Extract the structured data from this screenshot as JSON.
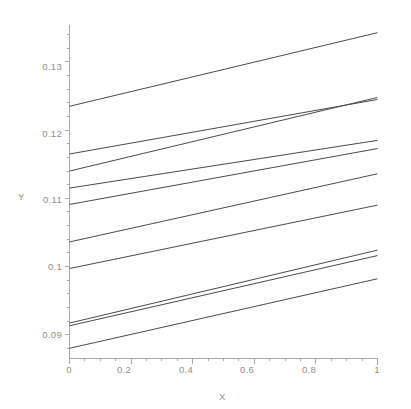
{
  "chart_data": {
    "type": "line",
    "title": "",
    "xlabel": "X",
    "ylabel": "Y",
    "xlim": [
      0,
      1
    ],
    "ylim": [
      0.0865,
      0.1355
    ],
    "grid": false,
    "legend": "none",
    "x_ticks": [
      0,
      0.2,
      0.4,
      0.6,
      0.8,
      1
    ],
    "x_tick_labels": [
      "0",
      "0.2",
      "0.4",
      "0.6",
      "0.8",
      "1"
    ],
    "y_ticks": [
      0.09,
      0.1,
      0.11,
      0.12,
      0.13
    ],
    "y_tick_labels": [
      "0.09",
      "0.1",
      "0.11",
      "0.12",
      "0.13"
    ],
    "x": [
      0,
      1
    ],
    "series": [
      {
        "name": "line-1",
        "values": [
          0.1235,
          0.1343
        ]
      },
      {
        "name": "line-2",
        "values": [
          0.1165,
          0.1245
        ]
      },
      {
        "name": "line-3",
        "values": [
          0.114,
          0.1248
        ]
      },
      {
        "name": "line-4",
        "values": [
          0.1115,
          0.1185
        ]
      },
      {
        "name": "line-5",
        "values": [
          0.1091,
          0.1173
        ]
      },
      {
        "name": "line-6",
        "values": [
          0.1036,
          0.1136
        ]
      },
      {
        "name": "line-7",
        "values": [
          0.0997,
          0.109
        ]
      },
      {
        "name": "line-8",
        "values": [
          0.0917,
          0.1024
        ]
      },
      {
        "name": "line-9",
        "values": [
          0.0913,
          0.1016
        ]
      },
      {
        "name": "line-10",
        "values": [
          0.088,
          0.0982
        ]
      }
    ],
    "line_color": "#4a4a4a",
    "axis_color": "#a8a8a8",
    "background_color": "#ffffff"
  },
  "axes": {
    "x_title": "X",
    "y_title": "Y"
  }
}
